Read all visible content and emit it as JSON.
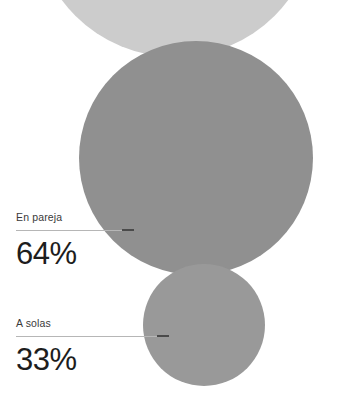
{
  "canvas": {
    "width": 344,
    "height": 399,
    "background": "#ffffff"
  },
  "palette": {
    "bubble_light": "#cccccc",
    "bubble_main": "#909090",
    "bubble_small": "#999999",
    "leader_line": "#b6b6b6",
    "leader_tip": "#4a4a4a",
    "label_text": "#3a3a3a",
    "value_text": "#1d1d1d"
  },
  "callouts": [
    {
      "label": "En pareja",
      "value": "64%",
      "leader_name": "leader-line-en-pareja"
    },
    {
      "label": "A solas",
      "value": "33%",
      "leader_name": "leader-line-a-solas"
    }
  ],
  "chart_data": {
    "type": "bubble",
    "title": "",
    "subtitle": "",
    "xlabel": "",
    "ylabel": "",
    "grid": false,
    "legend": "none",
    "units": "percent",
    "annotations": [
      "En pareja",
      "A solas"
    ],
    "categories": [
      "(sin etiqueta)",
      "En pareja",
      "A solas"
    ],
    "values": [
      null,
      64,
      33
    ],
    "series": [
      {
        "name": "Proporcion",
        "values": [
          null,
          64,
          33
        ]
      }
    ],
    "points": [
      {
        "name": "bubble-top-unlabeled",
        "label": "",
        "value": null,
        "color": "#cccccc",
        "cx": 175,
        "cy": -84,
        "r": 141,
        "clipped": true
      },
      {
        "name": "bubble-en-pareja",
        "label": "En pareja",
        "value": 64,
        "value_text": "64%",
        "color": "#909090",
        "cx": 196,
        "cy": 158,
        "r": 117,
        "clipped": false
      },
      {
        "name": "bubble-a-solas",
        "label": "A solas",
        "value": 33,
        "value_text": "33%",
        "color": "#999999",
        "cx": 204,
        "cy": 325,
        "r": 61,
        "clipped": false
      }
    ]
  }
}
